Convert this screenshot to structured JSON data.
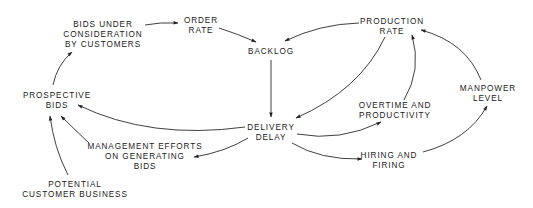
{
  "diagram": {
    "type": "causal-loop",
    "nodes": {
      "bids_under_consideration": {
        "lines": [
          "BIDS UNDER",
          "CONSIDERATION",
          "BY CUSTOMERS"
        ]
      },
      "order_rate": {
        "lines": [
          "ORDER",
          "RATE"
        ]
      },
      "backlog": {
        "lines": [
          "BACKLOG"
        ]
      },
      "production_rate": {
        "lines": [
          "PRODUCTION",
          "RATE"
        ]
      },
      "prospective_bids": {
        "lines": [
          "PROSPECTIVE",
          "BIDS"
        ]
      },
      "delivery_delay": {
        "lines": [
          "DELIVERY",
          "DELAY"
        ]
      },
      "overtime_productivity": {
        "lines": [
          "OVERTIME AND",
          "PRODUCTIVITY"
        ]
      },
      "manpower_level": {
        "lines": [
          "MANPOWER",
          "LEVEL"
        ]
      },
      "management_efforts": {
        "lines": [
          "MANAGEMENT EFFORTS",
          "ON GENERATING",
          "BIDS"
        ]
      },
      "hiring_firing": {
        "lines": [
          "HIRING AND",
          "FIRING"
        ]
      },
      "potential_customer_business": {
        "lines": [
          "POTENTIAL",
          "CUSTOMER BUSINESS"
        ]
      }
    },
    "edges": [
      {
        "from": "Bids under consideration by customers",
        "to": "Order rate"
      },
      {
        "from": "Order rate",
        "to": "Backlog"
      },
      {
        "from": "Production rate",
        "to": "Backlog"
      },
      {
        "from": "Backlog",
        "to": "Delivery delay"
      },
      {
        "from": "Production rate",
        "to": "Delivery delay"
      },
      {
        "from": "Delivery delay",
        "to": "Prospective bids"
      },
      {
        "from": "Delivery delay",
        "to": "Management efforts on generating bids"
      },
      {
        "from": "Delivery delay",
        "to": "Overtime and productivity"
      },
      {
        "from": "Delivery delay",
        "to": "Hiring and firing"
      },
      {
        "from": "Overtime and productivity",
        "to": "Production rate"
      },
      {
        "from": "Hiring and firing",
        "to": "Manpower level"
      },
      {
        "from": "Manpower level",
        "to": "Production rate"
      },
      {
        "from": "Management efforts on generating bids",
        "to": "Prospective bids"
      },
      {
        "from": "Potential customer business",
        "to": "Prospective bids"
      },
      {
        "from": "Prospective bids",
        "to": "Bids under consideration by customers"
      }
    ]
  }
}
